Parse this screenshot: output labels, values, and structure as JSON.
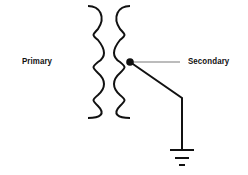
{
  "diagram": {
    "type": "transformer-schematic",
    "labels": {
      "primary": "Primary",
      "secondary": "Secondary"
    },
    "components": [
      "primary-coil",
      "secondary-coil",
      "center-tap-node",
      "ground-symbol"
    ],
    "colors": {
      "stroke": "#111111",
      "background": "#ffffff"
    }
  }
}
